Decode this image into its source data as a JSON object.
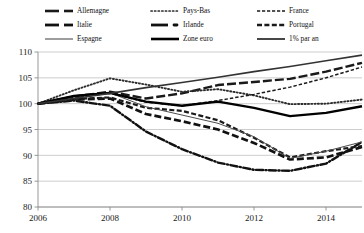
{
  "legend": {
    "columns": 3,
    "items": [
      {
        "label": "Allemagne",
        "style": "thick-dash",
        "icon": "legend-line-allemagne"
      },
      {
        "label": "Pays-Bas",
        "style": "dotted",
        "icon": "legend-line-pays-bas"
      },
      {
        "label": "France",
        "style": "fine-dash",
        "icon": "legend-line-france"
      },
      {
        "label": "Italie",
        "style": "thick-dash-short",
        "icon": "legend-line-italie"
      },
      {
        "label": "Irlande",
        "style": "dash-dot",
        "icon": "legend-line-irlande"
      },
      {
        "label": "Portugal",
        "style": "medium-dash",
        "icon": "legend-line-portugal"
      },
      {
        "label": "Espagne",
        "style": "thin-solid",
        "icon": "legend-line-espagne"
      },
      {
        "label": "Zone euro",
        "style": "thick-solid",
        "icon": "legend-line-zone-euro"
      },
      {
        "label": "1% par an",
        "style": "solid",
        "icon": "legend-line-1-pct"
      }
    ]
  },
  "chart_data": {
    "type": "line",
    "title": "",
    "subtitle": "",
    "xlabel": "",
    "ylabel": "",
    "xlim": [
      2006,
      2015
    ],
    "ylim": [
      80,
      110
    ],
    "yticks": [
      80,
      85,
      90,
      95,
      100,
      105,
      110
    ],
    "ytick_labels": [
      "80",
      "85",
      "90",
      "95",
      "100",
      "105",
      "110"
    ],
    "xticks": [
      2006,
      2008,
      2010,
      2012,
      2014
    ],
    "xtick_labels": [
      "2006",
      "2008",
      "2010",
      "2012",
      "2014"
    ],
    "grid": "horizontal",
    "legend_position": "top",
    "x": [
      2006,
      2007,
      2008,
      2009,
      2010,
      2011,
      2012,
      2013,
      2014,
      2015
    ],
    "series": [
      {
        "name": "Allemagne",
        "style": "thick-dash",
        "color": "#1a1a1a",
        "values": [
          100.0,
          101.4,
          102.3,
          101.0,
          102.0,
          103.6,
          104.2,
          104.8,
          106.2,
          107.9
        ]
      },
      {
        "name": "Pays-Bas",
        "style": "dotted",
        "color": "#2b2b2b",
        "values": [
          100.0,
          102.6,
          104.9,
          103.7,
          102.3,
          102.8,
          101.6,
          99.9,
          100.0,
          100.8
        ]
      },
      {
        "name": "France",
        "style": "fine-dash",
        "color": "#1a1a1a",
        "values": [
          100.0,
          101.2,
          102.0,
          100.3,
          99.6,
          100.6,
          101.8,
          103.2,
          105.0,
          107.1
        ]
      },
      {
        "name": "Italie",
        "style": "thick-dash-short",
        "color": "#111111",
        "values": [
          100.0,
          100.8,
          101.0,
          98.0,
          96.6,
          95.0,
          92.4,
          89.2,
          89.6,
          91.6
        ]
      },
      {
        "name": "Irlande",
        "style": "dash-dot",
        "color": "#111111",
        "values": [
          100.0,
          100.6,
          99.6,
          94.6,
          91.2,
          88.6,
          87.2,
          87.0,
          88.4,
          92.6
        ]
      },
      {
        "name": "Portugal",
        "style": "medium-dash",
        "color": "#1a1a1a",
        "values": [
          100.0,
          100.9,
          101.2,
          99.2,
          98.6,
          96.8,
          93.4,
          89.6,
          90.8,
          91.8
        ]
      },
      {
        "name": "Espagne",
        "style": "thin-solid",
        "color": "#4d4d4d",
        "values": [
          100.0,
          101.5,
          102.1,
          99.4,
          97.8,
          96.2,
          93.6,
          89.4,
          90.8,
          92.6
        ]
      },
      {
        "name": "Zone euro",
        "style": "thick-solid",
        "color": "#000000",
        "values": [
          100.0,
          101.5,
          102.1,
          100.4,
          99.6,
          100.4,
          99.2,
          97.6,
          98.2,
          99.5
        ]
      },
      {
        "name": "1% par an",
        "style": "solid",
        "color": "#333333",
        "values": [
          100.0,
          101.0,
          102.0,
          103.1,
          104.1,
          105.1,
          106.2,
          107.2,
          108.3,
          109.4
        ]
      }
    ]
  }
}
